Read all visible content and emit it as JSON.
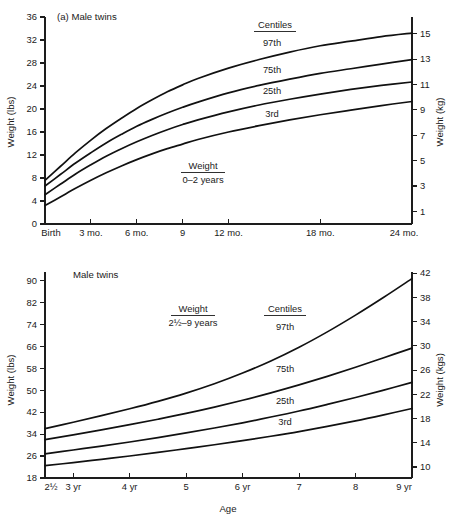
{
  "figure": {
    "panels": [
      {
        "id": "infant-weight-panel",
        "title": "(a)  Male twins",
        "annotation": {
          "line1": "Weight",
          "line2": "0–2 years"
        },
        "centiles_header": "Centiles",
        "left_axis_title": "Weight (lbs)",
        "right_axis_title": "Weight (kg)",
        "x_axis_title": ""
      },
      {
        "id": "child-weight-panel",
        "title": "Male twins",
        "annotation": {
          "line1": "Weight",
          "line2": "2½–9 years"
        },
        "centiles_header": "Centiles",
        "left_axis_title": "Weight (lbs)",
        "right_axis_title": "Weight (kgs)",
        "x_axis_title": "Age"
      }
    ]
  },
  "chart_data": [
    {
      "type": "line",
      "id": "male-twins-weight-0-2-years",
      "title": "(a)  Male twins",
      "subtitle": "Weight 0–2 years",
      "xlabel": "",
      "ylabel": "Weight (lbs)",
      "y2label": "Weight (kg)",
      "grid": false,
      "legend": "inline-curve-labels",
      "legend_header": "Centiles",
      "x_tick_labels": [
        "Birth",
        "3 mo.",
        "6 mo.",
        "9",
        "12 mo.",
        "18 mo.",
        "24 mo."
      ],
      "x_tick_values": [
        0,
        3,
        6,
        9,
        12,
        18,
        24
      ],
      "xlim": [
        0,
        24
      ],
      "y_tick_labels": [
        "0",
        "4",
        "8",
        "12",
        "16",
        "20",
        "24",
        "28",
        "32",
        "36"
      ],
      "y_tick_values": [
        0,
        4,
        8,
        12,
        16,
        20,
        24,
        28,
        32,
        36
      ],
      "ylim": [
        0,
        36
      ],
      "y2_tick_labels": [
        "1",
        "3",
        "5",
        "7",
        "9",
        "11",
        "13",
        "15"
      ],
      "y2_tick_values": [
        1,
        3,
        5,
        7,
        9,
        11,
        13,
        15
      ],
      "y2lim_lbs": [
        2.2,
        33.1
      ],
      "x": [
        0,
        1,
        2,
        3,
        4,
        5,
        6,
        7,
        8,
        9,
        10,
        12,
        14,
        16,
        18,
        20,
        22,
        24
      ],
      "series": [
        {
          "name": "97th",
          "unit": "lbs",
          "values": [
            7.6,
            10.0,
            12.4,
            14.6,
            16.6,
            18.4,
            20.1,
            21.6,
            23.0,
            24.2,
            25.3,
            27.1,
            28.6,
            29.9,
            31.0,
            31.8,
            32.6,
            33.2
          ]
        },
        {
          "name": "75th",
          "unit": "lbs",
          "values": [
            6.6,
            8.6,
            10.6,
            12.4,
            14.1,
            15.6,
            17.0,
            18.2,
            19.3,
            20.3,
            21.2,
            22.8,
            24.1,
            25.2,
            26.2,
            27.0,
            27.8,
            28.6
          ]
        },
        {
          "name": "25th",
          "unit": "lbs",
          "values": [
            5.1,
            6.9,
            8.7,
            10.3,
            11.8,
            13.1,
            14.3,
            15.4,
            16.4,
            17.3,
            18.1,
            19.5,
            20.7,
            21.7,
            22.6,
            23.4,
            24.1,
            24.7
          ]
        },
        {
          "name": "3rd",
          "unit": "lbs",
          "values": [
            3.2,
            4.7,
            6.2,
            7.6,
            8.9,
            10.1,
            11.2,
            12.2,
            13.1,
            13.9,
            14.7,
            16.0,
            17.1,
            18.1,
            19.0,
            19.8,
            20.6,
            21.3
          ]
        }
      ]
    },
    {
      "type": "line",
      "id": "male-twins-weight-2.5-9-years",
      "title": "Male twins",
      "subtitle": "Weight 2½–9 years",
      "xlabel": "Age",
      "ylabel": "Weight (lbs)",
      "y2label": "Weight (kgs)",
      "grid": false,
      "legend": "inline-curve-labels",
      "legend_header": "Centiles",
      "x_tick_labels": [
        "2½",
        "3 yr",
        "4 yr",
        "5",
        "6 yr",
        "7",
        "8",
        "9 yr"
      ],
      "x_tick_values": [
        2.5,
        3,
        4,
        5,
        6,
        7,
        8,
        9
      ],
      "xlim": [
        2.5,
        9
      ],
      "y_tick_labels": [
        "18",
        "26",
        "34",
        "42",
        "50",
        "58",
        "66",
        "74",
        "82",
        "90"
      ],
      "y_tick_values": [
        18,
        26,
        34,
        42,
        50,
        58,
        66,
        74,
        82,
        90
      ],
      "ylim": [
        18,
        93
      ],
      "y2_tick_labels": [
        "10",
        "14",
        "18",
        "22",
        "26",
        "30",
        "34",
        "38",
        "42"
      ],
      "y2_tick_values": [
        10,
        14,
        18,
        22,
        26,
        30,
        34,
        38,
        42
      ],
      "y2lim_lbs": [
        22.0,
        92.6
      ],
      "x": [
        2.5,
        3,
        3.5,
        4,
        4.5,
        5,
        5.5,
        6,
        6.5,
        7,
        7.5,
        8,
        8.5,
        9
      ],
      "series": [
        {
          "name": "97th",
          "unit": "lbs",
          "values": [
            36.0,
            38.3,
            40.7,
            43.2,
            45.9,
            48.9,
            52.3,
            56.2,
            60.6,
            65.6,
            71.2,
            77.3,
            83.8,
            90.6
          ]
        },
        {
          "name": "75th",
          "unit": "lbs",
          "values": [
            32.0,
            33.7,
            35.5,
            37.4,
            39.4,
            41.5,
            43.8,
            46.3,
            49.0,
            51.9,
            55.0,
            58.3,
            61.8,
            65.3
          ]
        },
        {
          "name": "25th",
          "unit": "lbs",
          "values": [
            26.8,
            28.2,
            29.6,
            31.1,
            32.7,
            34.4,
            36.2,
            38.1,
            40.2,
            42.4,
            44.8,
            47.3,
            50.0,
            52.8
          ]
        },
        {
          "name": "3rd",
          "unit": "lbs",
          "values": [
            22.5,
            23.6,
            24.8,
            26.0,
            27.3,
            28.7,
            30.1,
            31.6,
            33.2,
            34.9,
            36.8,
            38.8,
            41.0,
            43.3
          ]
        }
      ]
    }
  ]
}
